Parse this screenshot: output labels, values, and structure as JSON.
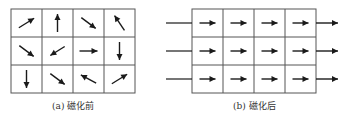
{
  "panels": [
    {
      "id": "a",
      "caption": "(a) 磁化前",
      "grid": {
        "left": 11,
        "top": 9,
        "cols": 4,
        "rows": 3,
        "cell_w": 31,
        "cell_h": 28
      },
      "cells": [
        [
          {
            "dir": "up-right"
          },
          {
            "dir": "up"
          },
          {
            "dir": "down-right"
          },
          {
            "dir": "up-left"
          }
        ],
        [
          {
            "dir": "down-right"
          },
          {
            "dir": "down-left"
          },
          {
            "dir": "right"
          },
          {
            "dir": "down"
          }
        ],
        [
          {
            "dir": "down"
          },
          {
            "dir": "down-right"
          },
          {
            "dir": "left-up"
          },
          {
            "dir": "up-right"
          }
        ]
      ]
    },
    {
      "id": "b",
      "caption": "(b) 磁化后",
      "grid": {
        "left": 192,
        "top": 9,
        "cols": 4,
        "rows": 3,
        "cell_w": 31,
        "cell_h": 28
      },
      "cells": [
        [
          {
            "dir": "right"
          },
          {
            "dir": "right"
          },
          {
            "dir": "right"
          },
          {
            "dir": "right"
          }
        ],
        [
          {
            "dir": "right"
          },
          {
            "dir": "right"
          },
          {
            "dir": "right"
          },
          {
            "dir": "right"
          }
        ],
        [
          {
            "dir": "right"
          },
          {
            "dir": "right"
          },
          {
            "dir": "right"
          },
          {
            "dir": "right"
          }
        ]
      ],
      "external_field_arrows": true
    }
  ],
  "colors": {
    "line": "#555555",
    "arrow": "#1a1a1a"
  }
}
